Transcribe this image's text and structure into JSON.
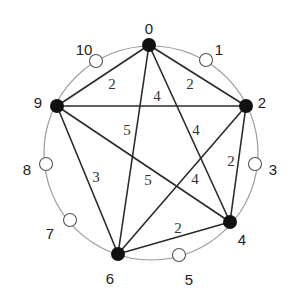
{
  "diagram": {
    "type": "circulant-graph",
    "center": [
      151,
      153
    ],
    "radius": 107,
    "colors": {
      "ring": "#9a9a9a",
      "edge": "#2b2b2b",
      "filled_node": "#111111",
      "empty_node_stroke": "#555555"
    },
    "nodes": [
      {
        "id": "0",
        "filled": true,
        "x": 149,
        "y": 45,
        "label": "0",
        "lx": 149,
        "ly": 29
      },
      {
        "id": "1",
        "filled": false,
        "x": 206,
        "y": 60,
        "label": "1",
        "lx": 219,
        "ly": 50
      },
      {
        "id": "2",
        "filled": true,
        "x": 246,
        "y": 106,
        "label": "2",
        "lx": 262,
        "ly": 103
      },
      {
        "id": "3",
        "filled": false,
        "x": 255,
        "y": 164,
        "label": "3",
        "lx": 273,
        "ly": 170
      },
      {
        "id": "4",
        "filled": true,
        "x": 230,
        "y": 222,
        "label": "4",
        "lx": 242,
        "ly": 240
      },
      {
        "id": "5",
        "filled": false,
        "x": 179,
        "y": 255,
        "label": "5",
        "lx": 189,
        "ly": 280
      },
      {
        "id": "6",
        "filled": true,
        "x": 118,
        "y": 254,
        "label": "6",
        "lx": 110,
        "ly": 279
      },
      {
        "id": "7",
        "filled": false,
        "x": 70,
        "y": 220,
        "label": "7",
        "lx": 50,
        "ly": 234
      },
      {
        "id": "8",
        "filled": false,
        "x": 46,
        "y": 164,
        "label": "8",
        "lx": 27,
        "ly": 170
      },
      {
        "id": "9",
        "filled": true,
        "x": 57,
        "y": 106,
        "label": "9",
        "lx": 38,
        "ly": 103
      },
      {
        "id": "10",
        "filled": false,
        "x": 96,
        "y": 61,
        "label": "10",
        "lx": 84,
        "ly": 50
      }
    ],
    "edges": [
      {
        "from": "9",
        "to": "0",
        "weight": "2",
        "wx": 112,
        "wy": 89
      },
      {
        "from": "0",
        "to": "2",
        "weight": "2",
        "wx": 190,
        "wy": 89
      },
      {
        "from": "9",
        "to": "2",
        "weight": "4",
        "wx": 157,
        "wy": 101
      },
      {
        "from": "0",
        "to": "6",
        "weight": "5",
        "wx": 127,
        "wy": 135
      },
      {
        "from": "0",
        "to": "4",
        "weight": "4",
        "wx": 196,
        "wy": 135
      },
      {
        "from": "9",
        "to": "6",
        "weight": "3",
        "wx": 96,
        "wy": 182
      },
      {
        "from": "9",
        "to": "4",
        "weight": "5",
        "wx": 148,
        "wy": 185
      },
      {
        "from": "2",
        "to": "6",
        "weight": "4",
        "wx": 195,
        "wy": 184
      },
      {
        "from": "2",
        "to": "4",
        "weight": "2",
        "wx": 231,
        "wy": 166
      },
      {
        "from": "6",
        "to": "4",
        "weight": "2",
        "wx": 178,
        "wy": 233
      }
    ]
  }
}
